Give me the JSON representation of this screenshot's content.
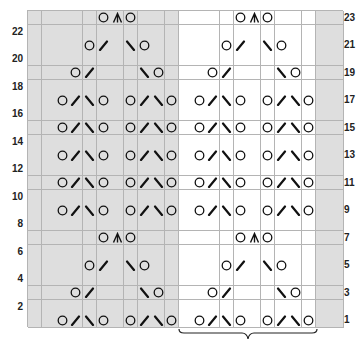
{
  "chart_title": "",
  "grid": {
    "columns": 23,
    "rows": 23,
    "cell_w": 13.7,
    "cell_h": 13.74
  },
  "colors": {
    "grey_cell": "#dedede",
    "white_cell": "#ffffff",
    "grid_line": "#b4b4b4",
    "symbol": "#111111"
  },
  "shading": {
    "grey_cols_left": [
      0,
      10
    ],
    "white_cols": [
      11,
      20
    ],
    "grey_cols_right": [
      21,
      22
    ]
  },
  "repeat_brace": {
    "from_col": 11,
    "to_col": 20
  },
  "left_labels": [
    "22",
    "20",
    "18",
    "16",
    "14",
    "12",
    "10",
    "8",
    "6",
    "4",
    "2"
  ],
  "right_labels": [
    "23",
    "21",
    "19",
    "17",
    "15",
    "13",
    "11",
    "9",
    "7",
    "5",
    "3",
    "1"
  ],
  "legend_symbols": {
    "O": "yarn-over",
    "/": "k2tog",
    "\\": "ssk",
    "^": "s2kp centered double decrease"
  },
  "rows": [
    {
      "row": 1,
      "cells": {
        "2": "O",
        "3": "/",
        "4": "\\",
        "5": "O",
        "7": "O",
        "8": "/",
        "9": "\\",
        "10": "O",
        "12": "O",
        "13": "/",
        "14": "\\",
        "15": "O",
        "17": "O",
        "18": "/",
        "19": "\\",
        "20": "O"
      }
    },
    {
      "row": 3,
      "cells": {
        "3": "O",
        "4": "/",
        "8": "\\",
        "9": "O",
        "13": "O",
        "14": "/",
        "18": "\\",
        "19": "O"
      }
    },
    {
      "row": 5,
      "cells": {
        "4": "O",
        "5": "/",
        "7": "\\",
        "8": "O",
        "14": "O",
        "15": "/",
        "17": "\\",
        "18": "O"
      }
    },
    {
      "row": 7,
      "cells": {
        "5": "O",
        "6": "^",
        "7": "O",
        "15": "O",
        "16": "^",
        "17": "O"
      }
    },
    {
      "row": 9,
      "cells": {
        "2": "O",
        "3": "/",
        "4": "\\",
        "5": "O",
        "7": "O",
        "8": "/",
        "9": "\\",
        "10": "O",
        "12": "O",
        "13": "/",
        "14": "\\",
        "15": "O",
        "17": "O",
        "18": "/",
        "19": "\\",
        "20": "O"
      }
    },
    {
      "row": 11,
      "cells": {
        "2": "O",
        "3": "/",
        "4": "\\",
        "5": "O",
        "7": "O",
        "8": "/",
        "9": "\\",
        "10": "O",
        "12": "O",
        "13": "/",
        "14": "\\",
        "15": "O",
        "17": "O",
        "18": "/",
        "19": "\\",
        "20": "O"
      }
    },
    {
      "row": 13,
      "cells": {
        "2": "O",
        "3": "/",
        "4": "\\",
        "5": "O",
        "7": "O",
        "8": "/",
        "9": "\\",
        "10": "O",
        "12": "O",
        "13": "/",
        "14": "\\",
        "15": "O",
        "17": "O",
        "18": "/",
        "19": "\\",
        "20": "O"
      }
    },
    {
      "row": 15,
      "cells": {
        "2": "O",
        "3": "/",
        "4": "\\",
        "5": "O",
        "7": "O",
        "8": "/",
        "9": "\\",
        "10": "O",
        "12": "O",
        "13": "/",
        "14": "\\",
        "15": "O",
        "17": "O",
        "18": "/",
        "19": "\\",
        "20": "O"
      }
    },
    {
      "row": 17,
      "cells": {
        "2": "O",
        "3": "/",
        "4": "\\",
        "5": "O",
        "7": "O",
        "8": "/",
        "9": "\\",
        "10": "O",
        "12": "O",
        "13": "/",
        "14": "\\",
        "15": "O",
        "17": "O",
        "18": "/",
        "19": "\\",
        "20": "O"
      }
    },
    {
      "row": 19,
      "cells": {
        "3": "O",
        "4": "/",
        "8": "\\",
        "9": "O",
        "13": "O",
        "14": "/",
        "18": "\\",
        "19": "O"
      }
    },
    {
      "row": 21,
      "cells": {
        "4": "O",
        "5": "/",
        "7": "\\",
        "8": "O",
        "14": "O",
        "15": "/",
        "17": "\\",
        "18": "O"
      }
    },
    {
      "row": 23,
      "cells": {
        "5": "O",
        "6": "^",
        "7": "O",
        "15": "O",
        "16": "^",
        "17": "O"
      }
    }
  ]
}
